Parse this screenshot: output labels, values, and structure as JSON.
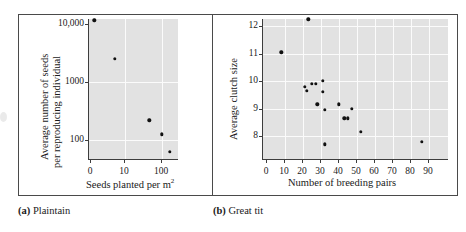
{
  "figure": {
    "background": "#ffffff",
    "plot_background": "#e2e2e2",
    "gridline_color": "#fbfbfb",
    "point_color": "#111111",
    "axis_color": "#3d3d3d"
  },
  "panels": [
    {
      "key": "plaintain",
      "caption_letter": "(a)",
      "caption_text": "Plaintain"
    },
    {
      "key": "great_tit",
      "caption_letter": "(b)",
      "caption_text": "Great tit"
    }
  ],
  "chart_data": [
    {
      "type": "scatter",
      "title": "",
      "panel_label": "(a) Plaintain",
      "xlabel": "Seeds planted per m2",
      "xlabel_display": "Seeds planted per m",
      "xlabel_superscript": "2",
      "ylabel": "Average number of seeds per reproducing individual",
      "ylabel_line1": "Average number of seeds",
      "ylabel_line2": "per reproducing individual",
      "yscale": "log",
      "ytick_labels": [
        "10,000",
        "1000",
        "100"
      ],
      "ytick_values": [
        10000,
        1000,
        100
      ],
      "xtick_labels": [
        "0",
        "10",
        "100"
      ],
      "xtick_values": [
        0,
        10,
        100
      ],
      "grid": true,
      "x": [
        1,
        7,
        45,
        100,
        160
      ],
      "y": [
        11500,
        2500,
        220,
        125,
        62
      ],
      "points": [
        {
          "x": 1,
          "y": 11500
        },
        {
          "x": 7,
          "y": 2500
        },
        {
          "x": 45,
          "y": 220
        },
        {
          "x": 100,
          "y": 125
        },
        {
          "x": 160,
          "y": 62
        }
      ]
    },
    {
      "type": "scatter",
      "title": "",
      "panel_label": "(b) Great tit",
      "xlabel": "Number of breeding pairs",
      "ylabel": "Average clutch size",
      "yscale": "linear",
      "ylim": [
        7.4,
        12.6
      ],
      "xlim": [
        0,
        97
      ],
      "ytick_labels": [
        "8",
        "9",
        "10",
        "11",
        "12"
      ],
      "ytick_values": [
        8,
        9,
        10,
        11,
        12
      ],
      "xtick_labels": [
        "0",
        "10",
        "20",
        "30",
        "40",
        "50",
        "60",
        "70",
        "80",
        "90"
      ],
      "xtick_values": [
        0,
        10,
        20,
        30,
        40,
        50,
        60,
        70,
        80,
        90
      ],
      "grid": true,
      "x": [
        8,
        23,
        21,
        22,
        25,
        27,
        28,
        31,
        31,
        32,
        30,
        40,
        43,
        45,
        47,
        50,
        52,
        32,
        86
      ],
      "y": [
        11.05,
        12.25,
        9.8,
        9.65,
        9.9,
        9.9,
        9.15,
        10.0,
        9.6,
        8.95,
        9.1,
        9.15,
        8.65,
        8.65,
        9.0,
        9.0,
        8.15,
        7.7,
        7.8
      ],
      "points": [
        {
          "x": 8,
          "y": 11.05
        },
        {
          "x": 23,
          "y": 12.25
        },
        {
          "x": 21,
          "y": 9.8
        },
        {
          "x": 22,
          "y": 9.65
        },
        {
          "x": 25,
          "y": 9.9
        },
        {
          "x": 27,
          "y": 9.9
        },
        {
          "x": 28,
          "y": 9.15
        },
        {
          "x": 31,
          "y": 10.0
        },
        {
          "x": 31,
          "y": 9.6
        },
        {
          "x": 32,
          "y": 8.95
        },
        {
          "x": 40,
          "y": 9.15
        },
        {
          "x": 43,
          "y": 8.65
        },
        {
          "x": 45,
          "y": 8.65
        },
        {
          "x": 47,
          "y": 9.0
        },
        {
          "x": 52,
          "y": 8.15
        },
        {
          "x": 32,
          "y": 7.7
        },
        {
          "x": 86,
          "y": 7.8
        }
      ]
    }
  ]
}
